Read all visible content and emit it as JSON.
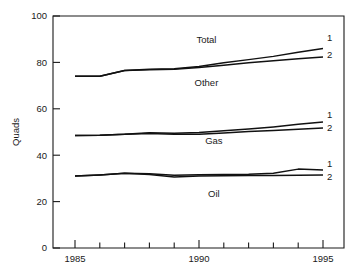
{
  "chart_data": {
    "type": "line",
    "title": "",
    "xlabel": "",
    "ylabel": "Quads",
    "xlim": [
      1985,
      1995
    ],
    "ylim": [
      0,
      100
    ],
    "grid": false,
    "legend_position": "inline-right-end",
    "x": [
      1985,
      1986,
      1987,
      1988,
      1989,
      1990,
      1991,
      1992,
      1993,
      1994,
      1995
    ],
    "x_tick_values": [
      1985,
      1986,
      1987,
      1988,
      1989,
      1990,
      1991,
      1992,
      1993,
      1994,
      1995
    ],
    "x_tick_labels": [
      "1985",
      "",
      "",
      "",
      "",
      "1990",
      "",
      "",
      "",
      "",
      "1995"
    ],
    "y_tick_values": [
      0,
      20,
      40,
      60,
      80,
      100
    ],
    "y_tick_labels": [
      "0",
      "20",
      "40",
      "60",
      "80",
      "100"
    ],
    "series": [
      {
        "name": "Total 1",
        "end_tag": "1",
        "values": [
          74.0,
          74.0,
          76.5,
          77.0,
          77.3,
          78.2,
          79.8,
          81.2,
          82.6,
          84.4,
          86.0
        ]
      },
      {
        "name": "Total 2",
        "end_tag": "2",
        "values": [
          74.0,
          74.0,
          76.5,
          76.8,
          77.0,
          77.8,
          78.8,
          79.8,
          80.7,
          81.6,
          82.3
        ]
      },
      {
        "name": "Gas 1",
        "end_tag": "1",
        "values": [
          48.5,
          48.6,
          49.0,
          49.7,
          49.5,
          49.8,
          50.5,
          51.3,
          52.2,
          53.3,
          54.3
        ]
      },
      {
        "name": "Gas 2",
        "end_tag": "2",
        "values": [
          48.5,
          48.6,
          49.0,
          49.4,
          49.0,
          49.0,
          49.6,
          50.2,
          50.7,
          51.2,
          51.7
        ]
      },
      {
        "name": "Oil 1",
        "end_tag": "1",
        "values": [
          31.0,
          31.5,
          32.2,
          32.0,
          31.4,
          31.6,
          31.7,
          31.8,
          32.2,
          34.0,
          33.6
        ]
      },
      {
        "name": "Oil 2",
        "end_tag": "2",
        "values": [
          31.0,
          31.5,
          32.2,
          31.7,
          30.6,
          31.0,
          31.1,
          31.2,
          31.3,
          31.4,
          31.5
        ]
      }
    ],
    "band_labels": [
      {
        "text": "Total",
        "x": 1990.3,
        "y": 88.5
      },
      {
        "text": "Other",
        "x": 1990.3,
        "y": 70.0
      },
      {
        "text": "Gas",
        "x": 1990.6,
        "y": 45.0
      },
      {
        "text": "Oil",
        "x": 1990.6,
        "y": 22.2
      }
    ]
  },
  "axis": {
    "y_title": "Quads"
  },
  "end_tags": {
    "total_1": "1",
    "total_2": "2",
    "gas_1": "1",
    "gas_2": "2",
    "oil_1": "1",
    "oil_2": "2"
  }
}
